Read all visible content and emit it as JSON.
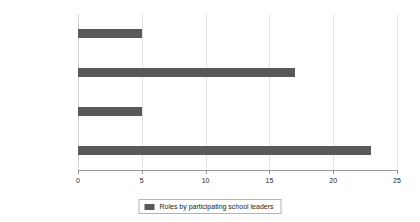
{
  "chart_data": {
    "type": "bar",
    "orientation": "horizontal",
    "title": "",
    "xlabel": "",
    "ylabel": "",
    "categories": [
      "Other",
      "Business Manager",
      "Deputy Principal",
      "Principal"
    ],
    "values": [
      5,
      17,
      5,
      23
    ],
    "series": [
      {
        "name": "Roles by participating school leaders",
        "values": [
          5,
          17,
          5,
          23
        ]
      }
    ],
    "xlim": [
      0,
      25
    ],
    "xticks": [
      0,
      5,
      10,
      15,
      20,
      25
    ],
    "xtick_labels": [
      "0",
      "5",
      "10",
      "15",
      "20",
      "25"
    ],
    "grid": true,
    "grid_axis": "x",
    "legend": {
      "position": "bottom-center",
      "entries": [
        {
          "label": "Roles by participating school leaders",
          "color": "#595959"
        }
      ]
    },
    "colors": {
      "bar": "#595959",
      "gridline": "#e3e3e3",
      "axis": "#9a9a9a",
      "text": "#1a1a1a",
      "background": "#ffffff",
      "legend_border": "#b4b4b4"
    }
  }
}
